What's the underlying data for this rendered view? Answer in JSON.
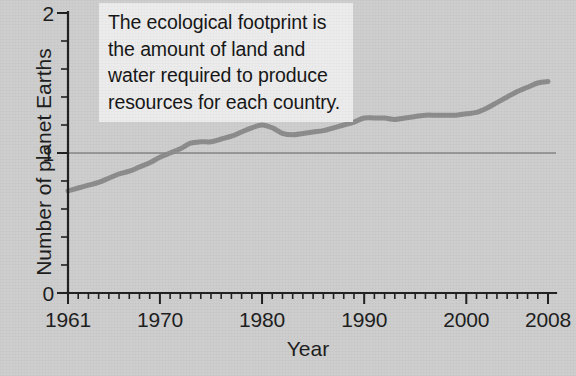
{
  "annotation": {
    "text": "The ecological footprint is the amount of land and water required to produce resources for each country."
  },
  "colors": {
    "background": "#cdcdcd",
    "series_line": "#8b8b8b",
    "axis": "#1d1d1d",
    "reference_line": "#5e5e5e",
    "annotation_background": "#ececec",
    "text": "#1b1b1b"
  },
  "chart_data": {
    "type": "line",
    "title": "",
    "xlabel": "Year",
    "ylabel": "Number of planet Earths",
    "xlim": [
      1961,
      2008
    ],
    "ylim": [
      0,
      2
    ],
    "grid": false,
    "legend": "none",
    "x_tick_labels": [
      "1961",
      "1970",
      "1980",
      "1990",
      "2000",
      "2008"
    ],
    "x_tick_values": [
      1961,
      1970,
      1980,
      1990,
      2000,
      2008
    ],
    "x_minor_tick_step": 1,
    "y_tick_labels": [
      "0",
      "1",
      "2"
    ],
    "y_tick_values": [
      0,
      1,
      2
    ],
    "y_minor_tick_step": 0.2,
    "reference_lines": [
      {
        "y": 1,
        "label": ""
      }
    ],
    "series": [
      {
        "name": "Ecological footprint",
        "x": [
          1961,
          1962,
          1963,
          1964,
          1965,
          1966,
          1967,
          1968,
          1969,
          1970,
          1971,
          1972,
          1973,
          1974,
          1975,
          1976,
          1977,
          1978,
          1979,
          1980,
          1981,
          1982,
          1983,
          1984,
          1985,
          1986,
          1987,
          1988,
          1989,
          1990,
          1991,
          1992,
          1993,
          1994,
          1995,
          1996,
          1997,
          1998,
          1999,
          2000,
          2001,
          2002,
          2003,
          2004,
          2005,
          2006,
          2007,
          2008
        ],
        "values": [
          0.73,
          0.75,
          0.77,
          0.79,
          0.82,
          0.85,
          0.87,
          0.9,
          0.93,
          0.97,
          1.0,
          1.03,
          1.07,
          1.08,
          1.08,
          1.1,
          1.12,
          1.15,
          1.18,
          1.2,
          1.18,
          1.14,
          1.13,
          1.14,
          1.15,
          1.16,
          1.18,
          1.2,
          1.22,
          1.25,
          1.25,
          1.25,
          1.24,
          1.25,
          1.26,
          1.27,
          1.27,
          1.27,
          1.27,
          1.28,
          1.29,
          1.32,
          1.36,
          1.4,
          1.44,
          1.47,
          1.5,
          1.51
        ]
      }
    ]
  }
}
